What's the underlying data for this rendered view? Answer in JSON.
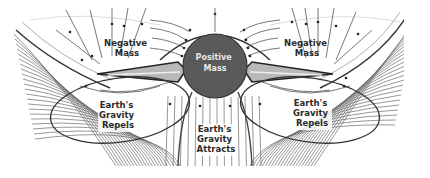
{
  "diagram": {
    "colors": {
      "background": "#ffffff",
      "field_line": "#555555",
      "dense_field": "#6a6a6a",
      "outline": "#2a2a2a",
      "positive_mass_fill": "#5a5a5a",
      "negative_mass_fill": "#b8b8b8",
      "label": "#2a2a2a",
      "positive_label": "#e8e8e8"
    },
    "labels": {
      "positive_mass": [
        "Positive",
        "Mass"
      ],
      "negative_mass_left": [
        "Negative",
        "Mass"
      ],
      "negative_mass_right": [
        "Negative",
        "Mass"
      ],
      "earth_repels_left": [
        "Earth's",
        "Gravity",
        "Repels"
      ],
      "earth_repels_right": [
        "Earth's",
        "Gravity",
        "Repels"
      ],
      "earth_attracts": [
        "Earth's",
        "Gravity",
        "Attracts"
      ]
    }
  }
}
